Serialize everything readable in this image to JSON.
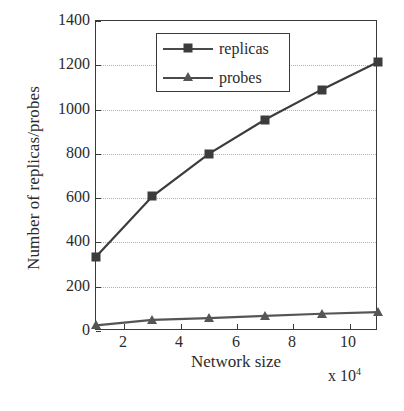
{
  "chart_data": {
    "type": "line",
    "title": "",
    "xlabel": "Network size",
    "ylabel": "Number of replicas/probes",
    "x_multiplier": "x 10",
    "x_multiplier_exp": "4",
    "x": [
      1,
      3,
      5,
      7,
      9,
      11
    ],
    "xlim": [
      1,
      11
    ],
    "ylim": [
      0,
      1400
    ],
    "xticks": [
      2,
      4,
      6,
      8,
      10
    ],
    "yticks": [
      0,
      200,
      400,
      600,
      800,
      1000,
      1200,
      1400
    ],
    "grid": "horizontal-dotted",
    "legend_position": "top-center",
    "series": [
      {
        "name": "replicas",
        "marker": "square",
        "color": "#3c3c3c",
        "values": [
          335,
          608,
          800,
          955,
          1090,
          1215
        ]
      },
      {
        "name": "probes",
        "marker": "triangle",
        "color": "#555555",
        "values": [
          25,
          50,
          58,
          68,
          78,
          85
        ]
      }
    ]
  },
  "axes": {
    "y_tick_labels": [
      "1400",
      "1200",
      "1000",
      "800",
      "600",
      "400",
      "200",
      "0"
    ],
    "x_tick_labels": [
      "2",
      "4",
      "6",
      "8",
      "10"
    ],
    "y_title": "Number of replicas/probes",
    "x_title": "Network size",
    "x_exponent_prefix": "x 10",
    "x_exponent_value": "4"
  },
  "legend": {
    "items": [
      {
        "label": "replicas",
        "marker": "square-marker"
      },
      {
        "label": "probes",
        "marker": "triangle-marker"
      }
    ]
  },
  "colors": {
    "axis": "#3a3a3a",
    "grid": "#b0b0b0",
    "replicas": "#3c3c3c",
    "probes": "#555555",
    "background": "#ffffff"
  }
}
